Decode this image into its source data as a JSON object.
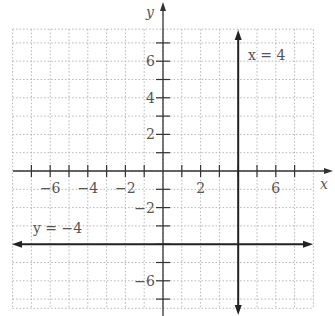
{
  "chart_data": {
    "type": "line",
    "title": "",
    "xlabel": "x",
    "ylabel": "y",
    "xlim": [
      -8,
      8
    ],
    "ylim": [
      -7.5,
      7.5
    ],
    "grid": true,
    "x_tick_labels": [
      "-6",
      "-4",
      "-2",
      "2",
      "6"
    ],
    "y_tick_labels": [
      "6",
      "4",
      "2",
      "-2",
      "-6"
    ],
    "series": [
      {
        "name": "x = 4",
        "type": "vertical",
        "x": 4,
        "label": "x = 4"
      },
      {
        "name": "y = -4",
        "type": "horizontal",
        "y": -4,
        "label": "y = −4"
      }
    ]
  },
  "axes": {
    "x_label": "x",
    "y_label": "y"
  },
  "labels": {
    "vertical_line": "x = 4",
    "horizontal_line": "y = −4"
  },
  "ticks": {
    "x": [
      {
        "value": -6,
        "text": "−6"
      },
      {
        "value": -4,
        "text": "−4"
      },
      {
        "value": -2,
        "text": "−2"
      },
      {
        "value": 2,
        "text": "2"
      },
      {
        "value": 6,
        "text": "6"
      }
    ],
    "y": [
      {
        "value": 6,
        "text": "6"
      },
      {
        "value": 4,
        "text": "4"
      },
      {
        "value": 2,
        "text": "2"
      },
      {
        "value": -2,
        "text": "−2"
      },
      {
        "value": -6,
        "text": "−6"
      }
    ]
  },
  "colors": {
    "axis": "#333333",
    "grid": "#b5b5b5",
    "line": "#222222",
    "text": "#555555"
  }
}
